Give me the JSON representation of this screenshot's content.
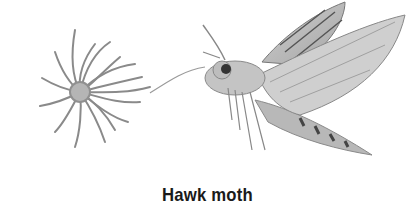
{
  "figure": {
    "caption": "Hawk moth",
    "subjects": [
      "flower",
      "hawk-moth"
    ],
    "style": "grayscale pencil illustration"
  }
}
